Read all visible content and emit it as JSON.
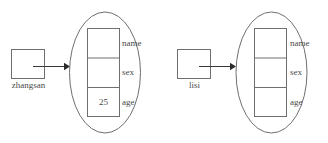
{
  "diagram": {
    "type": "object-reference-diagram",
    "colors": {
      "background": "#ffffff",
      "shape_stroke": "#6f6f6f",
      "connector": "#3a3a3a",
      "text": "#4a4a4a"
    },
    "groups": [
      {
        "variable": {
          "name": "zhangsan",
          "label": "zhangsan"
        },
        "object": {
          "fields": [
            {
              "label": "name",
              "value": ""
            },
            {
              "label": "sex",
              "value": ""
            },
            {
              "label": "age",
              "value": "25"
            }
          ]
        }
      },
      {
        "variable": {
          "name": "lisi",
          "label": "lisi"
        },
        "object": {
          "fields": [
            {
              "label": "name",
              "value": ""
            },
            {
              "label": "sex",
              "value": ""
            },
            {
              "label": "age",
              "value": ""
            }
          ]
        }
      }
    ]
  }
}
